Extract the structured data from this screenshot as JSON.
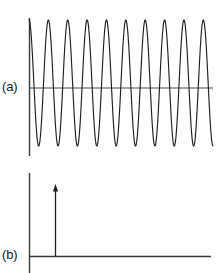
{
  "figure": {
    "name": "two-panel-signal-and-spectrum-figure",
    "background_color": "#ffffff",
    "line_color": "#1a1a1a",
    "axis_color": "#3a3a3a",
    "width": 219,
    "height": 273
  },
  "panels": {
    "a": {
      "label": "(a)",
      "label_x": 2,
      "label_y": 79
    },
    "b": {
      "label": "(b)",
      "label_x": 2,
      "label_y": 247
    }
  },
  "chart_data": [
    {
      "type": "line",
      "name": "panel-a-time-domain-sinusoid",
      "title": "",
      "subtitle": "",
      "xlabel": "",
      "ylabel": "",
      "panel_label": "(a)",
      "description": "Continuous sinusoidal waveform in the time domain, constant amplitude, about 9.5 full cycles drawn across the axis.",
      "waveform": "sine",
      "cycles": 9.5,
      "amplitude": 1.0,
      "baseline_value": 0,
      "phase_deg": 90,
      "grid": false,
      "legend": null,
      "axes": {
        "x_axis_visible": false,
        "y_axis_visible": true,
        "y_axis_x_px": 29,
        "y_axis_top_px": 18,
        "y_axis_bottom_px": 156,
        "centerline_visible": true,
        "centerline_y_px": 88,
        "centerline_x_start_px": 29,
        "centerline_x_end_px": 213,
        "plot_x_start_px": 29,
        "plot_x_end_px": 213,
        "plot_y_top_px": 20,
        "plot_y_bottom_px": 146
      },
      "series": [
        {
          "name": "carrier",
          "peak_x_px": [
            29,
            48,
            68,
            87,
            106,
            126,
            145,
            164,
            184,
            203
          ],
          "trough_x_px": [
            39,
            58,
            77,
            97,
            116,
            135,
            155,
            174,
            193,
            213
          ],
          "peak_y_px": 20,
          "trough_y_px": 146,
          "values_note": "amplitude +1 at each peak, -1 at each trough"
        }
      ]
    },
    {
      "type": "line",
      "name": "panel-b-frequency-domain-spectrum",
      "title": "",
      "subtitle": "",
      "xlabel": "",
      "ylabel": "",
      "panel_label": "(b)",
      "description": "Frequency-domain spectrum showing a single spectral line (delta impulse) drawn as an upward arrow at one frequency; baseline is flat and empty elsewhere.",
      "grid": false,
      "legend": null,
      "axes": {
        "x_axis_visible": true,
        "y_axis_visible": true,
        "y_axis_x_px": 29,
        "y_axis_top_px": 173,
        "y_axis_bottom_px": 273,
        "x_axis_y_px": 256,
        "x_axis_start_px": 29,
        "x_axis_end_px": 211
      },
      "series": [
        {
          "name": "spectral-line",
          "marker": "arrow",
          "x_px": [
            55
          ],
          "values": [
            1.0
          ],
          "arrow_base_y_px": 256,
          "arrow_tip_y_px": 184,
          "count": 1
        }
      ]
    }
  ]
}
